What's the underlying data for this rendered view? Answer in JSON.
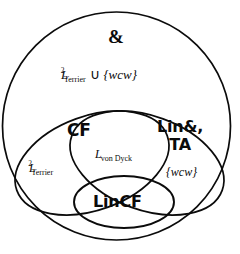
{
  "diagram": {
    "type": "venn-diagram",
    "background_color": "#ffffff",
    "stroke_color": "#0b0b0b",
    "regions": [
      {
        "id": "outer",
        "shape": "circle",
        "label": "&",
        "secondary_label": "L2_Terrier ∪ {wcw}"
      },
      {
        "id": "left-ellipse",
        "shape": "ellipse",
        "label": "CF",
        "secondary_label": "L2_Terrier"
      },
      {
        "id": "right-ellipse",
        "shape": "ellipse",
        "label": "Lin&, TA",
        "secondary_label": "{wcw}"
      },
      {
        "id": "inner-ellipse",
        "shape": "ellipse",
        "label": "LinCF"
      },
      {
        "id": "intersection",
        "shape": "lens",
        "label": "L_von Dyck"
      }
    ],
    "labels": {
      "ampersand": "&",
      "terrier_union": {
        "base": "L",
        "superscript": "2",
        "subscript": "Terrier",
        "operator": "∪",
        "set": "{wcw}"
      },
      "cf": "CF",
      "lin_ta": {
        "line1": "Lin&,",
        "line2": "TA"
      },
      "von_dyck": {
        "base": "L",
        "subscript": "von Dyck"
      },
      "terrier_left": {
        "base": "L",
        "superscript": "2",
        "subscript": "Terrier"
      },
      "wcw": "{wcw}",
      "lincf": "LinCF"
    }
  }
}
